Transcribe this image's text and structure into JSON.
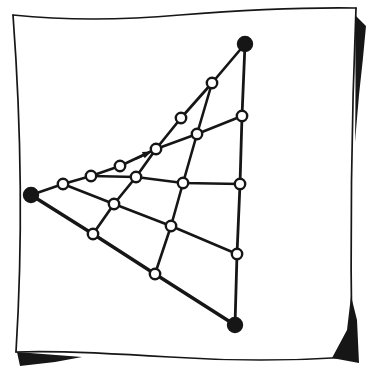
{
  "figure": {
    "kind": "hand-drawn projective net (Moebius net) diagram on a sketched square frame",
    "ink_color": "#161616",
    "paper_color": "#ffffff",
    "canvas": {
      "width": 372,
      "height": 381
    },
    "node_style": {
      "open_r": 5.2,
      "filled_r": 7,
      "stroke_width": 2.4
    },
    "nodes": [
      {
        "id": "top",
        "kind": "filled",
        "x": 245,
        "y": 44
      },
      {
        "id": "left",
        "kind": "filled",
        "x": 31,
        "y": 195
      },
      {
        "id": "bottom",
        "kind": "filled",
        "x": 235,
        "y": 325
      },
      {
        "id": "a",
        "kind": "open",
        "x": 212,
        "y": 83
      },
      {
        "id": "b",
        "kind": "open",
        "x": 242,
        "y": 116
      },
      {
        "id": "c",
        "kind": "open",
        "x": 181,
        "y": 118
      },
      {
        "id": "d",
        "kind": "open",
        "x": 197,
        "y": 134
      },
      {
        "id": "e",
        "kind": "open",
        "x": 156,
        "y": 149
      },
      {
        "id": "f",
        "kind": "open",
        "x": 120,
        "y": 166
      },
      {
        "id": "g",
        "kind": "open",
        "x": 91,
        "y": 176
      },
      {
        "id": "h",
        "kind": "open",
        "x": 63,
        "y": 184
      },
      {
        "id": "i",
        "kind": "open",
        "x": 136,
        "y": 177
      },
      {
        "id": "j",
        "kind": "open",
        "x": 183,
        "y": 183
      },
      {
        "id": "k",
        "kind": "open",
        "x": 240,
        "y": 184
      },
      {
        "id": "l",
        "kind": "open",
        "x": 114,
        "y": 204
      },
      {
        "id": "m",
        "kind": "open",
        "x": 171,
        "y": 226
      },
      {
        "id": "n",
        "kind": "open",
        "x": 93,
        "y": 234
      },
      {
        "id": "o",
        "kind": "open",
        "x": 237,
        "y": 254
      },
      {
        "id": "p",
        "kind": "open",
        "x": 155,
        "y": 274
      }
    ],
    "lines": [
      {
        "id": "upper-pencil",
        "width": 2.7,
        "points": [
          "top",
          "a",
          "c",
          "e",
          "i",
          "l",
          "n"
        ]
      },
      {
        "id": "lower-pencil",
        "width": 2.6,
        "points": [
          "left",
          "h",
          "g",
          "f",
          "e",
          "d",
          "b"
        ]
      },
      {
        "id": "right-vertical",
        "width": 2.8,
        "points": [
          "top",
          "b",
          "k",
          "o",
          "bottom"
        ]
      },
      {
        "id": "bottom-edge",
        "width": 3.4,
        "points": [
          "left",
          "n",
          "p",
          "bottom"
        ]
      },
      {
        "id": "steep-cross",
        "width": 2.6,
        "points": [
          "a",
          "d",
          "j",
          "m",
          "p"
        ]
      },
      {
        "id": "horizontal-cross",
        "width": 2.6,
        "points": [
          "g",
          "i",
          "j",
          "k"
        ]
      },
      {
        "id": "mid-cross",
        "width": 2.6,
        "points": [
          "h",
          "l",
          "m",
          "o"
        ]
      }
    ],
    "arrow": {
      "meaning": "small solid arrow on the lower pencil pointing toward the accumulation point",
      "tail_d": "M 136.5,158.5 L 145,154.8",
      "head_d": "M 151.5,151.5 L 144.7,158.3 L 141.9,151.9 Z"
    },
    "frame": {
      "strokes": [
        {
          "name": "frame-top-edge",
          "w": 1.7,
          "d": "M 13,15 Q 90,23 180,15 Q 280,7 356,8"
        },
        {
          "name": "frame-right-edge",
          "w": 1.7,
          "d": "M 356,8 Q 349,180 352,357"
        },
        {
          "name": "frame-bottom-edge",
          "w": 1.7,
          "d": "M 352,357 Q 260,363 170,357 Q 60,350 16,352"
        },
        {
          "name": "frame-left-edge",
          "w": 1.7,
          "d": "M 13,15 Q 26,190 16,352"
        }
      ],
      "shadows": [
        {
          "name": "shadow-right-top",
          "d": "M 355,15 L 366,26 Q 363,60 359,95 L 355,142 Q 356,80 355,15 Z"
        },
        {
          "name": "shadow-right-bottom",
          "d": "M 351,296 L 357,320 L 359,363 L 332,358 L 347,330 Z"
        },
        {
          "name": "shadow-bottom-left",
          "d": "M 17,352 L 82,357 L 55,362 L 20,366 Z"
        }
      ]
    }
  }
}
